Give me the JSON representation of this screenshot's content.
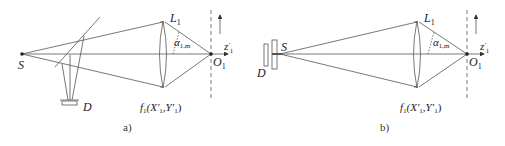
{
  "panels": [
    {
      "id": "a",
      "caption": "a)",
      "labels": {
        "source": "S",
        "lens": "L",
        "lens_sub": "1",
        "angle": "α",
        "angle_sub": "1,m",
        "axis": "z",
        "axis_sup": "′",
        "axis_sub": "1",
        "focus": "O",
        "focus_sub": "1",
        "detector": "D",
        "function": "f",
        "function_sub": "1",
        "function_args": "(X′",
        "function_args_sub1": "1",
        "function_args_mid": ",Y′",
        "function_args_sub2": "1",
        "function_close": ")"
      }
    },
    {
      "id": "b",
      "caption": "b)",
      "labels": {
        "source": "S",
        "lens": "L",
        "lens_sub": "1",
        "angle": "α",
        "angle_sub": "1,m",
        "axis": "z",
        "axis_sup": "′",
        "axis_sub": "1",
        "focus": "O",
        "focus_sub": "1",
        "detector": "D",
        "function": "f",
        "function_sub": "1",
        "function_args": "(X′",
        "function_args_sub1": "1",
        "function_args_mid": ",Y′",
        "function_args_sub2": "1",
        "function_close": ")"
      }
    }
  ],
  "colors": {
    "line": "#555555",
    "text": "#222222"
  }
}
